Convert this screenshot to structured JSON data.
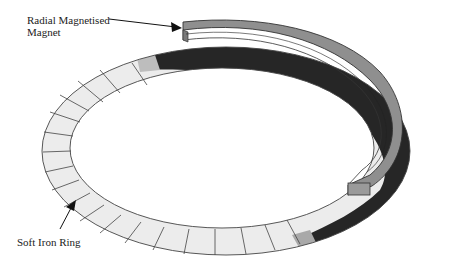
{
  "diagram": {
    "type": "3d-schematic",
    "labels": {
      "magnet_line1": "Radial Magnetised",
      "magnet_line2": "Magnet",
      "ring": "Soft Iron Ring"
    },
    "colors": {
      "ring_light": "#ececec",
      "ring_dark": "#262626",
      "magnet": "#8f8f8f",
      "outline": "#333333"
    }
  }
}
